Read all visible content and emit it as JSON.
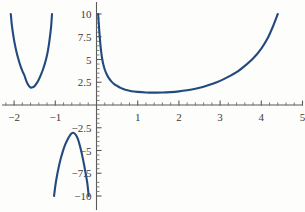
{
  "chart_data": {
    "type": "line",
    "title": "",
    "subtitle": "",
    "xlabel": "",
    "ylabel": "",
    "xlim": [
      -2.35,
      5.2
    ],
    "ylim": [
      -10,
      10
    ],
    "grid": false,
    "legend": null,
    "legend_position": "none",
    "curve_color": "#234a7d",
    "axis_color": "#5a5a5a",
    "background_color": "#fdfdfc",
    "x_ticks_major": [
      -2,
      -1,
      1,
      2,
      3,
      4,
      5
    ],
    "x_tick_labels": [
      "-2",
      "-1",
      "1",
      "2",
      "3",
      "4",
      "5"
    ],
    "x_ticks_minor": [
      -2.2,
      -1.8,
      -1.6,
      -1.4,
      -1.2,
      -0.8,
      -0.6,
      -0.4,
      -0.2,
      0.2,
      0.4,
      0.6,
      0.8,
      1.2,
      1.4,
      1.6,
      1.8,
      2.2,
      2.4,
      2.6,
      2.8,
      3.2,
      3.4,
      3.6,
      3.8,
      4.2,
      4.4,
      4.6,
      4.8,
      5.2
    ],
    "y_ticks_major": [
      -10,
      -7.5,
      -5,
      -2.5,
      2.5,
      5,
      7.5,
      10
    ],
    "y_tick_labels": [
      "-10",
      "-7.5",
      "-5",
      "-2.5",
      "2.5",
      "5",
      "7.5",
      "10"
    ],
    "y_ticks_minor": [
      -9.5,
      -9,
      -8.5,
      -7,
      -6.5,
      -6,
      -5.5,
      -4.5,
      -4,
      -3.5,
      -3,
      -2,
      -1.5,
      -1,
      -0.5,
      0.5,
      1,
      1.5,
      2,
      3,
      3.5,
      4,
      4.5,
      5.5,
      6,
      6.5,
      7,
      8,
      8.5,
      9,
      9.5
    ],
    "branches": [
      {
        "name": "left-branch",
        "description": "U-shaped branch left of a vertical asymptote near x = -1.05, rising off the top of the plot on both sides",
        "minimum": {
          "x": -1.6,
          "y": 1.9
        },
        "points": [
          [
            -2.08,
            10.0
          ],
          [
            -2.05,
            8.6
          ],
          [
            -2.0,
            7.1
          ],
          [
            -1.95,
            6.0
          ],
          [
            -1.9,
            5.1
          ],
          [
            -1.85,
            4.35
          ],
          [
            -1.8,
            3.75
          ],
          [
            -1.75,
            3.25
          ],
          [
            -1.7,
            2.6
          ],
          [
            -1.65,
            2.15
          ],
          [
            -1.6,
            1.92
          ],
          [
            -1.55,
            1.95
          ],
          [
            -1.5,
            2.1
          ],
          [
            -1.45,
            2.4
          ],
          [
            -1.4,
            2.8
          ],
          [
            -1.35,
            3.3
          ],
          [
            -1.3,
            3.9
          ],
          [
            -1.25,
            4.6
          ],
          [
            -1.2,
            5.5
          ],
          [
            -1.16,
            6.5
          ],
          [
            -1.13,
            7.5
          ],
          [
            -1.1,
            8.7
          ],
          [
            -1.08,
            10.0
          ]
        ]
      },
      {
        "name": "bottom-branch",
        "description": "Inverted-U branch between the vertical asymptotes near x = -1.05 and x = 0, peaking below the x-axis",
        "maximum": {
          "x": -0.57,
          "y": -3.05
        },
        "points": [
          [
            -1.03,
            -10.0
          ],
          [
            -1.0,
            -8.9
          ],
          [
            -0.96,
            -7.8
          ],
          [
            -0.92,
            -6.9
          ],
          [
            -0.88,
            -6.1
          ],
          [
            -0.84,
            -5.45
          ],
          [
            -0.8,
            -4.85
          ],
          [
            -0.76,
            -4.35
          ],
          [
            -0.72,
            -3.95
          ],
          [
            -0.68,
            -3.6
          ],
          [
            -0.64,
            -3.3
          ],
          [
            -0.6,
            -3.1
          ],
          [
            -0.57,
            -3.05
          ],
          [
            -0.54,
            -3.1
          ],
          [
            -0.5,
            -3.3
          ],
          [
            -0.46,
            -3.65
          ],
          [
            -0.42,
            -4.2
          ],
          [
            -0.38,
            -4.9
          ],
          [
            -0.34,
            -5.7
          ],
          [
            -0.3,
            -6.6
          ],
          [
            -0.26,
            -7.6
          ],
          [
            -0.22,
            -8.7
          ],
          [
            -0.19,
            -10.0
          ]
        ]
      },
      {
        "name": "right-branch",
        "description": "Branch right of the vertical asymptote at x = 0: falls steeply from the top, flattens to a shallow minimum near x = 1.5, then rises off the top of the plot near x = 4.4",
        "minimum": {
          "x": 1.5,
          "y": 1.38
        },
        "points": [
          [
            0.04,
            10.0
          ],
          [
            0.06,
            8.6
          ],
          [
            0.08,
            7.4
          ],
          [
            0.1,
            6.4
          ],
          [
            0.13,
            5.3
          ],
          [
            0.16,
            4.55
          ],
          [
            0.2,
            3.9
          ],
          [
            0.25,
            3.35
          ],
          [
            0.3,
            2.95
          ],
          [
            0.36,
            2.6
          ],
          [
            0.43,
            2.3
          ],
          [
            0.5,
            2.1
          ],
          [
            0.6,
            1.85
          ],
          [
            0.7,
            1.68
          ],
          [
            0.85,
            1.52
          ],
          [
            1.0,
            1.44
          ],
          [
            1.2,
            1.38
          ],
          [
            1.4,
            1.36
          ],
          [
            1.6,
            1.37
          ],
          [
            1.8,
            1.42
          ],
          [
            2.0,
            1.5
          ],
          [
            2.2,
            1.62
          ],
          [
            2.4,
            1.78
          ],
          [
            2.6,
            2.0
          ],
          [
            2.8,
            2.3
          ],
          [
            3.0,
            2.65
          ],
          [
            3.2,
            3.1
          ],
          [
            3.4,
            3.6
          ],
          [
            3.6,
            4.3
          ],
          [
            3.8,
            5.1
          ],
          [
            4.0,
            6.2
          ],
          [
            4.15,
            7.3
          ],
          [
            4.28,
            8.6
          ],
          [
            4.4,
            10.0
          ]
        ]
      }
    ]
  }
}
